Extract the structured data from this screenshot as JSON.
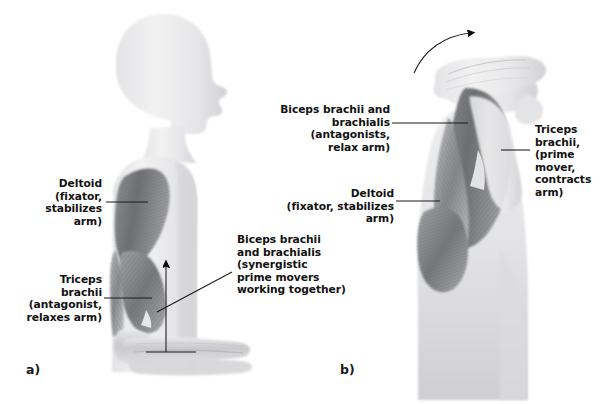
{
  "figure": {
    "background_color": "#ffffff",
    "width": 613,
    "height": 404
  },
  "panels": [
    {
      "id": "a",
      "label": "a)",
      "description": "Standing figure with arm flexed at the elbow; biceps brachii and brachialis act as synergistic prime movers.",
      "movement_arrow": "up-arrow",
      "annotations": [
        {
          "name": "deltoid",
          "align": "right",
          "text": "Deltoid\n(fixator,\nstabilizes\narm)"
        },
        {
          "name": "triceps-brachii",
          "align": "right",
          "text": "Triceps\nbrachii\n(antagonist,\nrelaxes arm)"
        },
        {
          "name": "biceps-brachii-brachialis",
          "align": "left",
          "text": "Biceps brachii\nand brachialis\n(synergistic\nprime movers\nworking together)"
        }
      ]
    },
    {
      "id": "b",
      "label": "b)",
      "description": "Bent-forward figure with arm extended backward; triceps brachii acts as the prime mover.",
      "movement_arrow": "curved-arrow",
      "annotations": [
        {
          "name": "biceps-brachii-brachialis",
          "align": "right",
          "text": "Biceps brachii and\nbrachialis (antagonists,\nrelax arm)"
        },
        {
          "name": "deltoid",
          "align": "right",
          "text": "Deltoid\n(fixator, stabilizes arm)"
        },
        {
          "name": "triceps-brachii",
          "align": "left",
          "text": "Triceps\nbrachii,\n(prime\nmover,\ncontracts\narm)"
        }
      ]
    }
  ],
  "colors": {
    "skin_light": "#ececed",
    "skin_mid": "#dcdcde",
    "muscle_dark": "#6f7173",
    "muscle_mid": "#98999c",
    "line": "#1a1a1a",
    "text": "#121212"
  }
}
